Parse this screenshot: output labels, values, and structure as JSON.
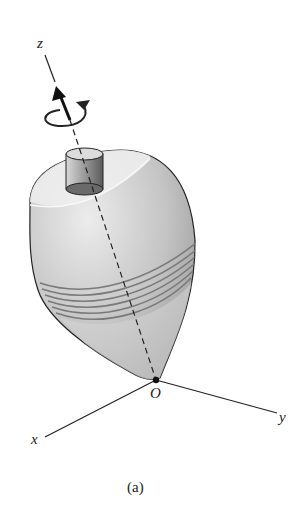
{
  "figure": {
    "caption": "(a)",
    "axes": {
      "z_label": "z",
      "x_label": "x",
      "y_label": "y",
      "origin_label": "O"
    },
    "icons": {
      "spin_arrow": "rotation-arrow-icon",
      "axis_arrow": "arrow-up-icon"
    },
    "colors": {
      "line": "#222222",
      "body_light": "#e6e6e6",
      "body_mid": "#bdbdbd",
      "body_dark": "#8a8a8a",
      "bands": "#777777"
    }
  }
}
